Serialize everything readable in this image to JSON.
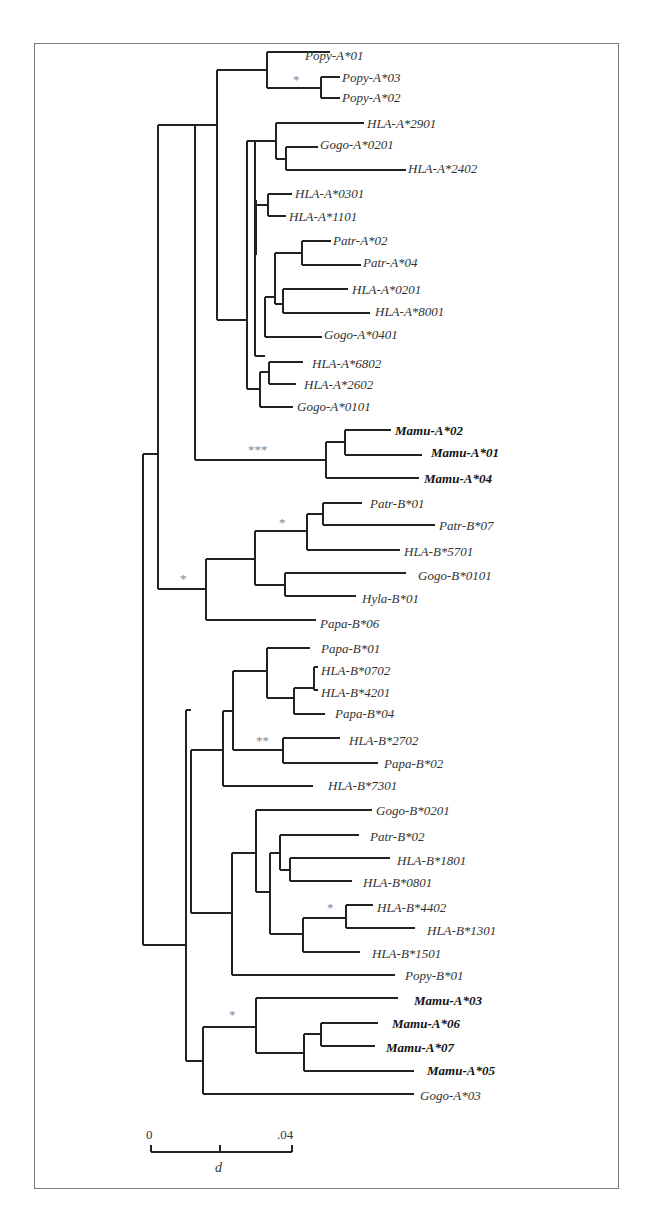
{
  "figure": {
    "type": "phylogenetic-tree",
    "frame_color": "#7a7a7a",
    "branch_color": "#222222",
    "support_color": "#888888"
  },
  "taxa": [
    {
      "name": "Popy-A*01",
      "x": 303,
      "y": 55,
      "bold": false
    },
    {
      "name": "Popy-A*03",
      "x": 340,
      "y": 77,
      "bold": false
    },
    {
      "name": "Popy-A*02",
      "x": 340,
      "y": 97,
      "bold": false
    },
    {
      "name": "HLA-A*2901",
      "x": 365,
      "y": 123,
      "bold": false
    },
    {
      "name": "Gogo-A*0201",
      "x": 318,
      "y": 144,
      "bold": false
    },
    {
      "name": "HLA-A*2402",
      "x": 406,
      "y": 168,
      "bold": false
    },
    {
      "name": "HLA-A*0301",
      "x": 293,
      "y": 193,
      "bold": false
    },
    {
      "name": "HLA-A*1101",
      "x": 287,
      "y": 216,
      "bold": false
    },
    {
      "name": "Patr-A*02",
      "x": 331,
      "y": 240,
      "bold": false
    },
    {
      "name": "Patr-A*04",
      "x": 361,
      "y": 262,
      "bold": false
    },
    {
      "name": "HLA-A*0201",
      "x": 350,
      "y": 289,
      "bold": false
    },
    {
      "name": "HLA-A*8001",
      "x": 373,
      "y": 311,
      "bold": false
    },
    {
      "name": "Gogo-A*0401",
      "x": 322,
      "y": 334,
      "bold": false
    },
    {
      "name": "HLA-A*6802",
      "x": 310,
      "y": 363,
      "bold": false
    },
    {
      "name": "HLA-A*2602",
      "x": 302,
      "y": 384,
      "bold": false
    },
    {
      "name": "Gogo-A*0101",
      "x": 295,
      "y": 406,
      "bold": false
    },
    {
      "name": "Mamu-A*02",
      "x": 393,
      "y": 430,
      "bold": true
    },
    {
      "name": "Mamu-A*01",
      "x": 429,
      "y": 452,
      "bold": true
    },
    {
      "name": "Mamu-A*04",
      "x": 422,
      "y": 478,
      "bold": true
    },
    {
      "name": "Patr-B*01",
      "x": 368,
      "y": 503,
      "bold": false
    },
    {
      "name": "Patr-B*07",
      "x": 437,
      "y": 525,
      "bold": false
    },
    {
      "name": "HLA-B*5701",
      "x": 402,
      "y": 551,
      "bold": false
    },
    {
      "name": "Gogo-B*0101",
      "x": 416,
      "y": 575,
      "bold": false
    },
    {
      "name": "Hyla-B*01",
      "x": 360,
      "y": 598,
      "bold": false
    },
    {
      "name": "Papa-B*06",
      "x": 318,
      "y": 623,
      "bold": false
    },
    {
      "name": "Papa-B*01",
      "x": 319,
      "y": 648,
      "bold": false
    },
    {
      "name": "HLA-B*0702",
      "x": 319,
      "y": 670,
      "bold": false
    },
    {
      "name": "HLA-B*4201",
      "x": 319,
      "y": 692,
      "bold": false
    },
    {
      "name": "Papa-B*04",
      "x": 333,
      "y": 713,
      "bold": false
    },
    {
      "name": "HLA-B*2702",
      "x": 347,
      "y": 740,
      "bold": false
    },
    {
      "name": "Papa-B*02",
      "x": 382,
      "y": 763,
      "bold": false
    },
    {
      "name": "HLA-B*7301",
      "x": 326,
      "y": 785,
      "bold": false
    },
    {
      "name": "Gogo-B*0201",
      "x": 374,
      "y": 810,
      "bold": false
    },
    {
      "name": "Patr-B*02",
      "x": 368,
      "y": 836,
      "bold": false
    },
    {
      "name": "HLA-B*1801",
      "x": 395,
      "y": 860,
      "bold": false
    },
    {
      "name": "HLA-B*0801",
      "x": 361,
      "y": 882,
      "bold": false
    },
    {
      "name": "HLA-B*4402",
      "x": 375,
      "y": 907,
      "bold": false
    },
    {
      "name": "HLA-B*1301",
      "x": 425,
      "y": 930,
      "bold": false
    },
    {
      "name": "HLA-B*1501",
      "x": 370,
      "y": 953,
      "bold": false
    },
    {
      "name": "Popy-B*01",
      "x": 403,
      "y": 975,
      "bold": false
    },
    {
      "name": "Mamu-A*03",
      "x": 412,
      "y": 1000,
      "bold": true
    },
    {
      "name": "Mamu-A*06",
      "x": 390,
      "y": 1023,
      "bold": true
    },
    {
      "name": "Mamu-A*07",
      "x": 384,
      "y": 1047,
      "bold": true
    },
    {
      "name": "Mamu-A*05",
      "x": 425,
      "y": 1070,
      "bold": true
    },
    {
      "name": "Gogo-A*03",
      "x": 418,
      "y": 1095,
      "bold": false
    }
  ],
  "support_marks": [
    {
      "text": "*",
      "x": 293,
      "y": 84
    },
    {
      "text": "***",
      "x": 248,
      "y": 454
    },
    {
      "text": "*",
      "x": 279,
      "y": 527
    },
    {
      "text": "*",
      "x": 180,
      "y": 583
    },
    {
      "text": "**",
      "x": 256,
      "y": 745
    },
    {
      "text": "*",
      "x": 327,
      "y": 912
    },
    {
      "text": "*",
      "x": 229,
      "y": 1019
    }
  ],
  "scale_bar": {
    "start_label": "0",
    "end_label": ".04",
    "unit_label": "d",
    "x1": 151,
    "x2": 292,
    "y": 1152
  },
  "chart_data": {
    "type": "tree",
    "title": "",
    "scale": {
      "min": 0,
      "max": 0.04,
      "label": "d"
    },
    "bold_taxa": [
      "Mamu-A*02",
      "Mamu-A*01",
      "Mamu-A*04",
      "Mamu-A*03",
      "Mamu-A*06",
      "Mamu-A*07",
      "Mamu-A*05"
    ],
    "support_annotations": [
      "*",
      "***",
      "*",
      "*",
      "**",
      "*",
      "*"
    ]
  }
}
